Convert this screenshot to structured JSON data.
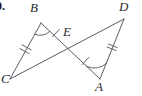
{
  "figure": {
    "type": "geometry-diagram",
    "problem_number": "0.",
    "stroke_color": "#4a4a52",
    "label_color": "#2b2b2b",
    "background_color": "#ffffff",
    "width": 142,
    "height": 96,
    "vertices": [
      {
        "name": "B",
        "label": "B",
        "x": 41,
        "y": 23,
        "label_x": 30,
        "label_y": 2
      },
      {
        "name": "D",
        "label": "D",
        "x": 124,
        "y": 19,
        "label_x": 120,
        "label_y": 1
      },
      {
        "name": "E",
        "label": "E",
        "x": 71,
        "y": 43,
        "label_x": 63,
        "label_y": 26
      },
      {
        "name": "C",
        "label": "C",
        "x": 10,
        "y": 79,
        "label_x": 2,
        "label_y": 74
      },
      {
        "name": "A",
        "label": "A",
        "x": 100,
        "y": 79,
        "label_x": 96,
        "label_y": 80
      }
    ],
    "segments": [
      {
        "name": "segment-CB",
        "from": "C",
        "to": "B",
        "ticks": 2
      },
      {
        "name": "segment-BE",
        "from": "B",
        "to": "E",
        "ticks": 1
      },
      {
        "name": "segment-CD",
        "from": "C",
        "to": "D",
        "ticks": 0
      },
      {
        "name": "segment-EA",
        "from": "E",
        "to": "A",
        "ticks": 1
      },
      {
        "name": "segment-AD",
        "from": "A",
        "to": "D",
        "ticks": 2
      }
    ],
    "angle_marks": [
      {
        "name": "angle-B",
        "vertex": "B",
        "arcs": 1
      },
      {
        "name": "angle-A",
        "vertex": "A",
        "arcs": 1
      }
    ]
  }
}
